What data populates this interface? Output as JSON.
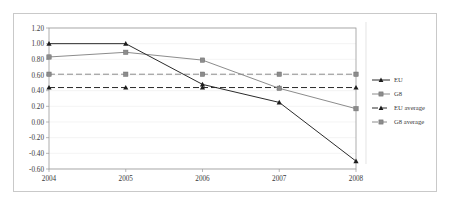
{
  "chart_data": {
    "type": "line",
    "title": "",
    "xlabel": "",
    "ylabel": "",
    "categories": [
      "2004",
      "2005",
      "2006",
      "2007",
      "2008"
    ],
    "x": [
      2004,
      2005,
      2006,
      2007,
      2008
    ],
    "ylim": [
      -0.6,
      1.2
    ],
    "ytick_labels": [
      "1.20",
      "1.00",
      "0.80",
      "0.60",
      "0.40",
      "0.20",
      "0.00",
      "-0.20",
      "-0.40",
      "-0.60"
    ],
    "ytick_values": [
      1.2,
      1.0,
      0.8,
      0.6,
      0.4,
      0.2,
      0.0,
      -0.2,
      -0.4,
      -0.6
    ],
    "grid": true,
    "legend_position": "right",
    "series": [
      {
        "name": "EU",
        "values": [
          1.0,
          1.0,
          0.48,
          0.25,
          -0.5
        ],
        "marker": "triangle",
        "style": "solid",
        "color": "#2b2b2b"
      },
      {
        "name": "G8",
        "values": [
          0.83,
          0.89,
          0.79,
          0.43,
          0.17
        ],
        "marker": "square",
        "style": "solid",
        "color": "#8c8c8c"
      },
      {
        "name": "EU average",
        "values": [
          0.44,
          0.44,
          0.44,
          0.44,
          0.44
        ],
        "marker": "triangle",
        "style": "dashed",
        "color": "#2b2b2b"
      },
      {
        "name": "G8 average",
        "values": [
          0.61,
          0.61,
          0.61,
          0.61,
          0.61
        ],
        "marker": "square",
        "style": "dashed",
        "color": "#8c8c8c"
      }
    ]
  },
  "legend": {
    "entries": [
      {
        "label": "EU"
      },
      {
        "label": "G8"
      },
      {
        "label": "EU average"
      },
      {
        "label": "G8 average"
      }
    ]
  },
  "axes": {
    "y": {
      "labels": [
        "1.20",
        "1.00",
        "0.80",
        "0.60",
        "0.40",
        "0.20",
        "0.00",
        "-0.20",
        "-0.40",
        "-0.60"
      ]
    },
    "x": {
      "labels": [
        "2004",
        "2005",
        "2006",
        "2007",
        "2008"
      ]
    }
  }
}
